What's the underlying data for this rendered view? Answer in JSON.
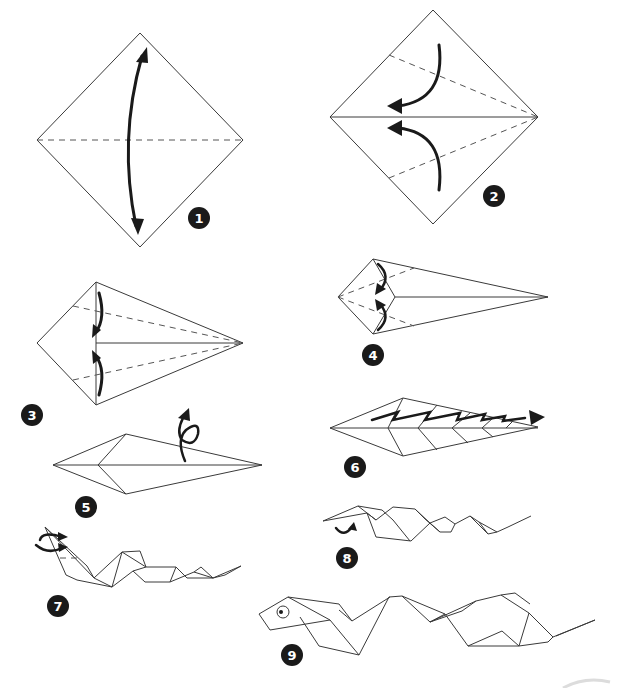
{
  "diagram": {
    "steps": [
      {
        "number": "1",
        "description": "Square diamond with horizontal valley fold, arrow fold up and down"
      },
      {
        "number": "2",
        "description": "Fold upper and lower edges to the center line"
      },
      {
        "number": "3",
        "description": "Kite shape, fold edges to center again"
      },
      {
        "number": "4",
        "description": "Narrow kite, fold left edges in"
      },
      {
        "number": "5",
        "description": "Long narrow shape, turn over"
      },
      {
        "number": "6",
        "description": "Zigzag pleat folds along body"
      },
      {
        "number": "7",
        "description": "Snake body with raised head, inside reverse fold"
      },
      {
        "number": "8",
        "description": "Fold the head down"
      },
      {
        "number": "9",
        "description": "Finished snake with eye"
      }
    ],
    "colors": {
      "line": "#3a3a3a",
      "arrow": "#1a1a1a",
      "badge": "#1a1a1a",
      "badge_text": "#ffffff",
      "background": "#ffffff"
    }
  }
}
